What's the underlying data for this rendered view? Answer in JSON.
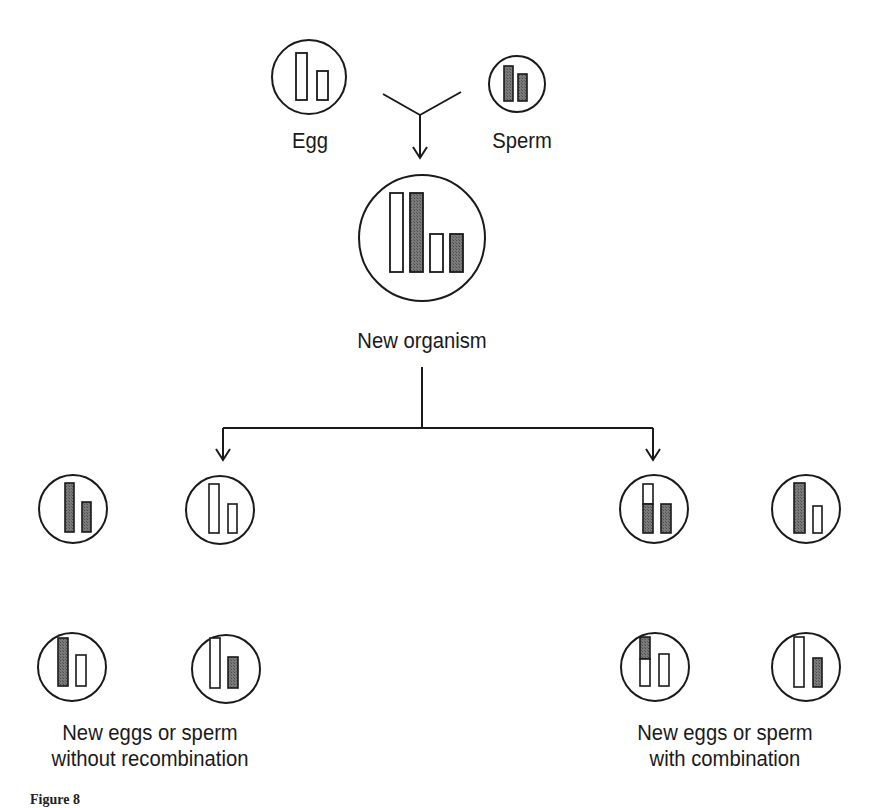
{
  "figure": {
    "caption": "Figure 8",
    "colors": {
      "stroke": "#1a1a1a",
      "shaded_fill": "#6b6b6b",
      "open_fill": "#ffffff",
      "background": "#ffffff"
    }
  },
  "parents": {
    "egg": {
      "label": "Egg",
      "chromosomes": [
        {
          "size": "long",
          "fill": "open"
        },
        {
          "size": "short",
          "fill": "open"
        }
      ]
    },
    "sperm": {
      "label": "Sperm",
      "chromosomes": [
        {
          "size": "long",
          "fill": "shaded"
        },
        {
          "size": "short",
          "fill": "shaded"
        }
      ]
    }
  },
  "organism": {
    "label": "New organism",
    "chromosomes": [
      {
        "size": "long",
        "fill": "open"
      },
      {
        "size": "long",
        "fill": "shaded"
      },
      {
        "size": "short",
        "fill": "open"
      },
      {
        "size": "short",
        "fill": "shaded"
      }
    ]
  },
  "groups": {
    "without": {
      "label_line1": "New eggs or sperm",
      "label_line2": "without recombination",
      "gametes": [
        {
          "chromosomes": [
            {
              "size": "long",
              "fill": "shaded"
            },
            {
              "size": "short",
              "fill": "shaded"
            }
          ]
        },
        {
          "chromosomes": [
            {
              "size": "long",
              "fill": "open"
            },
            {
              "size": "short",
              "fill": "open"
            }
          ]
        },
        {
          "chromosomes": [
            {
              "size": "long",
              "fill": "shaded"
            },
            {
              "size": "short",
              "fill": "open"
            }
          ]
        },
        {
          "chromosomes": [
            {
              "size": "long",
              "fill": "open"
            },
            {
              "size": "short",
              "fill": "shaded"
            }
          ]
        }
      ]
    },
    "with": {
      "label_line1": "New eggs or sperm",
      "label_line2": "with combination",
      "gametes": [
        {
          "chromosomes": [
            {
              "size": "long",
              "fill": "open-top/shaded-bottom"
            },
            {
              "size": "short",
              "fill": "shaded"
            }
          ]
        },
        {
          "chromosomes": [
            {
              "size": "long",
              "fill": "shaded"
            },
            {
              "size": "short",
              "fill": "open"
            }
          ]
        },
        {
          "chromosomes": [
            {
              "size": "long",
              "fill": "shaded-top/open-bottom"
            },
            {
              "size": "short",
              "fill": "open"
            }
          ]
        },
        {
          "chromosomes": [
            {
              "size": "long",
              "fill": "open"
            },
            {
              "size": "short",
              "fill": "shaded"
            }
          ]
        }
      ]
    }
  }
}
